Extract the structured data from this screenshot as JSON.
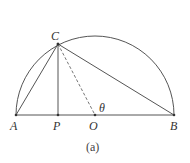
{
  "figure": {
    "caption": "(a)",
    "points": {
      "A": "A",
      "P": "P",
      "O": "O",
      "B": "B",
      "C": "C"
    },
    "angle_label": "θ"
  }
}
